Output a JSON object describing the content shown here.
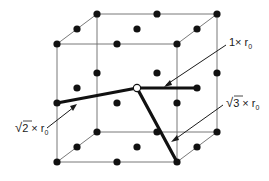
{
  "figure": {
    "type": "cubic lattice neighbor-distance diagram",
    "center_atom": "open circle at body center",
    "bonds": [
      {
        "id": "nearest",
        "label": "1× r",
        "subscript": "0",
        "multiplier": "1",
        "to": "right face center"
      },
      {
        "id": "second",
        "label": "2 × r",
        "subscript": "0",
        "multiplier": "√2",
        "to": "front-left edge midpoint"
      },
      {
        "id": "third",
        "label": "3 × r",
        "subscript": "0",
        "multiplier": "√3",
        "to": "front bottom-right corner"
      }
    ],
    "labels": {
      "one": {
        "prefix": "1× r",
        "sub": "0"
      },
      "sqrt2": {
        "radical": "√",
        "radicand": "2",
        "rest": " × r",
        "sub": "0"
      },
      "sqrt3": {
        "radical": "√",
        "radicand": "3",
        "rest": " × r",
        "sub": "0"
      }
    },
    "colors": {
      "atom": "#111111",
      "edge": "#6a6a6a",
      "bond": "#111111",
      "background": "#ffffff"
    }
  }
}
